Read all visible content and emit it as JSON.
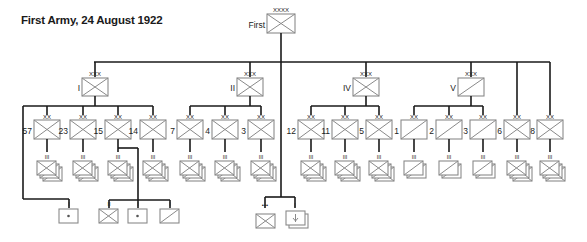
{
  "title": "First Army, 24 August 1922",
  "colors": {
    "line": "#1a1a1a",
    "box": "#8a8a8a",
    "box_fill": "#ffffff"
  },
  "army": {
    "name": "First",
    "echelon": "XXXX",
    "type": "infantry"
  },
  "corps": [
    {
      "name": "I",
      "echelon": "XXX",
      "type": "infantry",
      "divisions": [
        {
          "name": "57",
          "echelon": "XX",
          "type": "infantry",
          "sub": {
            "echelon": "III",
            "type": "infantry",
            "count": 3
          }
        },
        {
          "name": "23",
          "echelon": "XX",
          "type": "infantry",
          "sub": {
            "echelon": "III",
            "type": "infantry",
            "count": 3
          }
        },
        {
          "name": "15",
          "echelon": "XX",
          "type": "infantry",
          "sub": {
            "echelon": "III",
            "type": "infantry",
            "count": 3
          },
          "attached": [
            {
              "echelon": "II",
              "type": "infantry"
            },
            {
              "echelon": "I",
              "type": "artillery"
            },
            {
              "echelon": "I",
              "type": "cavalry"
            }
          ]
        },
        {
          "name": "14",
          "echelon": "XX",
          "type": "infantry",
          "sub": {
            "echelon": "III",
            "type": "infantry",
            "count": 3
          }
        }
      ],
      "attached": [
        {
          "echelon": "I",
          "type": "artillery"
        }
      ]
    },
    {
      "name": "II",
      "echelon": "XXX",
      "type": "infantry",
      "divisions": [
        {
          "name": "7",
          "echelon": "XX",
          "type": "infantry",
          "sub": {
            "echelon": "III",
            "type": "infantry",
            "count": 3
          }
        },
        {
          "name": "4",
          "echelon": "XX",
          "type": "infantry",
          "sub": {
            "echelon": "III",
            "type": "infantry",
            "count": 3
          }
        },
        {
          "name": "3",
          "echelon": "XX",
          "type": "infantry",
          "sub": {
            "echelon": "III",
            "type": "infantry",
            "count": 3
          }
        }
      ]
    },
    {
      "name": "IV",
      "echelon": "XXX",
      "type": "infantry",
      "divisions": [
        {
          "name": "12",
          "echelon": "XX",
          "type": "infantry",
          "sub": {
            "echelon": "III",
            "type": "infantry",
            "count": 3
          }
        },
        {
          "name": "11",
          "echelon": "XX",
          "type": "infantry",
          "sub": {
            "echelon": "III",
            "type": "infantry",
            "count": 3
          }
        },
        {
          "name": "5",
          "echelon": "XX",
          "type": "infantry",
          "sub": {
            "echelon": "III",
            "type": "infantry",
            "count": 3
          }
        }
      ]
    },
    {
      "name": "V",
      "echelon": "XXX",
      "type": "cavalry",
      "divisions": [
        {
          "name": "1",
          "echelon": "XX",
          "type": "cavalry",
          "sub": {
            "echelon": "III",
            "type": "cavalry",
            "count": 2
          }
        },
        {
          "name": "2",
          "echelon": "XX",
          "type": "cavalry",
          "sub": {
            "echelon": "III",
            "type": "cavalry",
            "count": 2
          }
        },
        {
          "name": "3",
          "echelon": "XX",
          "type": "cavalry",
          "sub": {
            "echelon": "III",
            "type": "cavalry",
            "count": 2
          }
        }
      ]
    }
  ],
  "independent_divisions": [
    {
      "name": "6",
      "echelon": "XX",
      "type": "infantry",
      "sub": {
        "echelon": "III",
        "type": "infantry",
        "count": 3
      }
    },
    {
      "name": "8",
      "echelon": "XX",
      "type": "infantry",
      "sub": {
        "echelon": "III",
        "type": "infantry",
        "count": 3
      }
    }
  ],
  "army_troops": [
    {
      "echelon": "•••",
      "type": "infantry"
    },
    {
      "echelon": "I",
      "type": "artillery-mountain",
      "count": 2
    }
  ]
}
